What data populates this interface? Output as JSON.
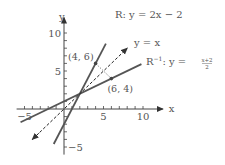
{
  "chart_data": {
    "type": "line",
    "title": "",
    "xlabel": "x",
    "ylabel": "y",
    "xlim": [
      -6,
      11.5
    ],
    "ylim": [
      -6,
      11.5
    ],
    "x_ticks": [
      -5,
      -4,
      -3,
      -2,
      -1,
      1,
      2,
      3,
      4,
      5,
      6,
      7,
      8,
      9,
      10
    ],
    "y_ticks": [
      -5,
      -4,
      -3,
      -2,
      -1,
      1,
      2,
      3,
      4,
      5,
      6,
      7,
      8,
      9,
      10
    ],
    "x_tick_labels": [
      {
        "value": -5,
        "text": "−5"
      },
      {
        "value": 5,
        "text": "5"
      },
      {
        "value": 10,
        "text": "10"
      }
    ],
    "y_tick_labels": [
      {
        "value": 10,
        "text": "10"
      },
      {
        "value": 5,
        "text": "5"
      },
      {
        "value": -5,
        "text": "−5"
      }
    ],
    "series": [
      {
        "name": "R",
        "label": "R:   y = 2x − 2",
        "slope": 2,
        "intercept": -2,
        "x_range": [
          -1.3,
          5.3
        ],
        "style": "solid"
      },
      {
        "name": "R-inverse",
        "label_main": "R",
        "label_sup": "−1",
        "label_rest": ":   y = ",
        "label_frac_num": "x+2",
        "label_frac_den": "2",
        "slope": 0.5,
        "intercept": 1,
        "x_range": [
          -5.5,
          9.8
        ],
        "style": "solid"
      },
      {
        "name": "identity",
        "label": "y = x",
        "slope": 1,
        "intercept": 0,
        "x_range": [
          -4,
          8
        ],
        "style": "dashed",
        "arrows": "both"
      }
    ],
    "points": [
      {
        "x": 4,
        "y": 6,
        "label": "(4, 6)"
      },
      {
        "x": 6,
        "y": 4,
        "label": "(6, 4)"
      }
    ],
    "connector": {
      "from": [
        4,
        6
      ],
      "to": [
        6,
        4
      ],
      "style": "dotted"
    }
  }
}
